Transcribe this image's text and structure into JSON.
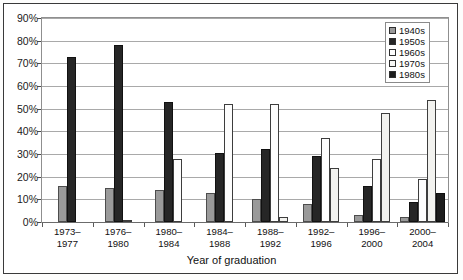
{
  "chart_data": {
    "type": "bar",
    "title": "",
    "xlabel": "Year of graduation",
    "ylabel": "",
    "ylim": [
      0,
      90
    ],
    "ytick_labels": [
      "90%",
      "80%",
      "70%",
      "60%",
      "50%",
      "40%",
      "30%",
      "20%",
      "10%",
      "0%"
    ],
    "ytick_values": [
      90,
      80,
      70,
      60,
      50,
      40,
      30,
      20,
      10,
      0
    ],
    "grid": true,
    "legend_position": "top-right",
    "grouping": "clustered",
    "categories": [
      "1973–\n1977",
      "1976–\n1980",
      "1980–\n1984",
      "1984–\n1988",
      "1988–\n1992",
      "1992–\n1996",
      "1996–\n2000",
      "2000–\n2004"
    ],
    "series": [
      {
        "name": "1940s",
        "color": "#9a9a9a",
        "values": [
          16,
          15,
          14,
          13,
          10,
          8,
          3,
          2
        ]
      },
      {
        "name": "1950s",
        "color": "#262626",
        "values": [
          73,
          78,
          53,
          30.5,
          32,
          29,
          16,
          9
        ]
      },
      {
        "name": "1960s",
        "color": "#fdfdfd",
        "values": [
          0,
          1,
          28,
          52,
          52,
          37,
          28,
          19
        ]
      },
      {
        "name": "1970s",
        "color": "#f2f2ef",
        "values": [
          0,
          0,
          0,
          0,
          2,
          24,
          48,
          54
        ]
      },
      {
        "name": "1980s",
        "color": "#1c1c1c",
        "values": [
          0,
          0,
          0,
          0,
          0,
          0,
          0,
          13
        ]
      }
    ]
  },
  "legend": {
    "items": [
      {
        "label": "1940s",
        "key": "s1940"
      },
      {
        "label": "1950s",
        "key": "s1950"
      },
      {
        "label": "1960s",
        "key": "s1960"
      },
      {
        "label": "1970s",
        "key": "s1970"
      },
      {
        "label": "1980s",
        "key": "s1980"
      }
    ]
  }
}
